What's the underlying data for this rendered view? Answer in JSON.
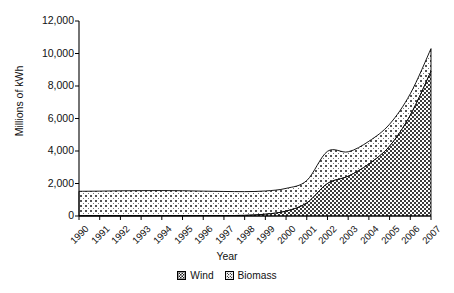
{
  "chart_data": {
    "type": "area",
    "stacked": true,
    "title": "",
    "xlabel": "Year",
    "ylabel": "Millions of kWh",
    "categories": [
      "1990",
      "1991",
      "1992",
      "1993",
      "1994",
      "1995",
      "1996",
      "1997",
      "1998",
      "1999",
      "2000",
      "2001",
      "2002",
      "2003",
      "2004",
      "2005",
      "2006",
      "2007"
    ],
    "ylim": [
      0,
      12000
    ],
    "ytick_labels": [
      "0",
      "2,000",
      "4,000",
      "6,000",
      "8,000",
      "10,000",
      "12,000"
    ],
    "ytick_values": [
      0,
      2000,
      4000,
      6000,
      8000,
      10000,
      12000
    ],
    "grid": false,
    "legend_position": "bottom",
    "series": [
      {
        "name": "Wind",
        "values": [
          20,
          20,
          20,
          20,
          25,
          25,
          30,
          30,
          40,
          110,
          300,
          800,
          2000,
          2450,
          3200,
          4300,
          6200,
          8900
        ]
      },
      {
        "name": "Biomass",
        "values": [
          1500,
          1510,
          1530,
          1540,
          1540,
          1530,
          1500,
          1480,
          1460,
          1430,
          1400,
          1380,
          1980,
          1500,
          1400,
          1350,
          1320,
          1400
        ]
      }
    ],
    "totals": [
      1520,
      1530,
      1550,
      1560,
      1565,
      1555,
      1530,
      1510,
      1500,
      1540,
      1700,
      2180,
      3980,
      3950,
      4600,
      5650,
      7520,
      10300
    ]
  },
  "legend": {
    "items": [
      {
        "label": "Wind",
        "pattern": "checkerboard-dense"
      },
      {
        "label": "Biomass",
        "pattern": "checkerboard-sparse"
      }
    ]
  }
}
